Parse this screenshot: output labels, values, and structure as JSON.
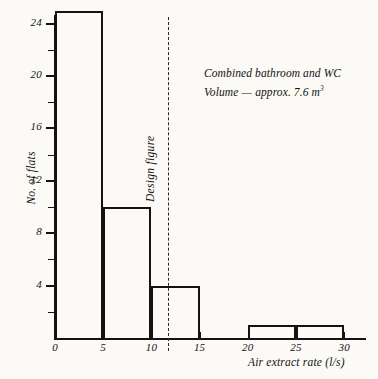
{
  "chart_data": {
    "type": "bar",
    "title": "",
    "subtitle": "",
    "xlabel": "Air extract rate (l/s)",
    "ylabel": "No. of flats",
    "xlim": [
      0,
      32.5
    ],
    "ylim": [
      0,
      25.7
    ],
    "grid": false,
    "legend": null,
    "bin_width": 5,
    "bins": [
      {
        "label": "0-5",
        "x0": 0,
        "x1": 5,
        "value": 25
      },
      {
        "label": "5-10",
        "x0": 5,
        "x1": 10,
        "value": 10
      },
      {
        "label": "10-15",
        "x0": 10,
        "x1": 15,
        "value": 4
      },
      {
        "label": "15-20",
        "x0": 15,
        "x1": 20,
        "value": 0
      },
      {
        "label": "20-25",
        "x0": 20,
        "x1": 25,
        "value": 1
      },
      {
        "label": "25-30",
        "x0": 25,
        "x1": 30,
        "value": 1
      }
    ],
    "categories": [
      "0-5",
      "5-10",
      "10-15",
      "15-20",
      "20-25",
      "25-30"
    ],
    "values": [
      25,
      10,
      4,
      0,
      1,
      1
    ],
    "x_ticks": [
      {
        "value": 0,
        "label": "0"
      },
      {
        "value": 5,
        "label": "5"
      },
      {
        "value": 10,
        "label": "10"
      },
      {
        "value": 15,
        "label": "15"
      },
      {
        "value": 20,
        "label": "20"
      },
      {
        "value": 25,
        "label": "25"
      },
      {
        "value": 30,
        "label": "30"
      }
    ],
    "y_ticks_major": [
      {
        "value": 4,
        "label": "4"
      },
      {
        "value": 8,
        "label": "8"
      },
      {
        "value": 12,
        "label": "12"
      },
      {
        "value": 16,
        "label": "16"
      },
      {
        "value": 20,
        "label": "20"
      },
      {
        "value": 24,
        "label": "24"
      }
    ],
    "y_ticks_minor": [
      2,
      6,
      10,
      14,
      18,
      22
    ],
    "reference_line": {
      "label": "Design figure",
      "value": 11.7,
      "style": "dashed"
    },
    "annotation": {
      "line1": "Combined bathroom and WC",
      "line2_pre": "Volume ",
      "line2_dash": "—",
      "line2_post": " approx. 7.6 m",
      "line2_exponent": "3"
    },
    "colors": {
      "ink": "#15130f",
      "background": "#fbfaf7",
      "bar_fill": "transparent",
      "bar_stroke": "#15130f",
      "reference_line": "#2a2722"
    }
  }
}
